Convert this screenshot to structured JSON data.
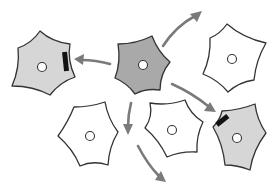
{
  "diagram": {
    "colors": {
      "background": "#ffffff",
      "outline": "#333333",
      "signaling_cell_fill": "#a9a9a9",
      "contacted_cell_fill": "#d6d6d6",
      "unaffected_cell_fill": "#ffffff",
      "arrow": "#7a7a7a",
      "contact_mark": "#111111"
    },
    "cells": [
      {
        "id": "source",
        "role": "signaling",
        "fill": "#a9a9a9",
        "center": [
          143,
          65
        ],
        "points": [
          [
            152,
            36
          ],
          [
            170,
            62
          ],
          [
            160,
            90
          ],
          [
            135,
            94
          ],
          [
            115,
            78
          ],
          [
            118,
            44
          ]
        ],
        "contact": false
      },
      {
        "id": "left",
        "role": "contacted",
        "fill": "#d6d6d6",
        "center": [
          42,
          67
        ],
        "points": [
          [
            40,
            31
          ],
          [
            70,
            44
          ],
          [
            75,
            77
          ],
          [
            50,
            95
          ],
          [
            12,
            86
          ],
          [
            18,
            48
          ]
        ],
        "contact": true
      },
      {
        "id": "top-right",
        "role": "unaffected",
        "fill": "#ffffff",
        "center": [
          232,
          59
        ],
        "points": [
          [
            227,
            24
          ],
          [
            266,
            43
          ],
          [
            254,
            80
          ],
          [
            228,
            92
          ],
          [
            203,
            74
          ],
          [
            210,
            38
          ]
        ],
        "contact": false
      },
      {
        "id": "bottom-left",
        "role": "unaffected",
        "fill": "#ffffff",
        "center": [
          90,
          136
        ],
        "points": [
          [
            105,
            102
          ],
          [
            118,
            132
          ],
          [
            108,
            165
          ],
          [
            80,
            166
          ],
          [
            58,
            136
          ],
          [
            74,
            107
          ]
        ],
        "contact": false
      },
      {
        "id": "bottom-middle",
        "role": "unaffected",
        "fill": "#ffffff",
        "center": [
          172,
          130
        ],
        "points": [
          [
            185,
            100
          ],
          [
            203,
            122
          ],
          [
            197,
            152
          ],
          [
            167,
            157
          ],
          [
            145,
            128
          ],
          [
            150,
            103
          ]
        ],
        "contact": false
      },
      {
        "id": "bottom-right",
        "role": "contacted",
        "fill": "#d6d6d6",
        "center": [
          237,
          138
        ],
        "points": [
          [
            255,
            104
          ],
          [
            266,
            133
          ],
          [
            250,
            170
          ],
          [
            225,
            165
          ],
          [
            213,
            127
          ],
          [
            222,
            111
          ]
        ],
        "contact": true
      }
    ],
    "arrows": [
      {
        "id": "to-left",
        "from": [
          110,
          64
        ],
        "to": [
          76,
          59
        ]
      },
      {
        "id": "to-top-right",
        "from": [
          163,
          45
        ],
        "to": [
          201,
          12
        ]
      },
      {
        "id": "to-bottom-right",
        "from": [
          172,
          84
        ],
        "to": [
          215,
          111
        ]
      },
      {
        "id": "to-bottom-middle-down",
        "from": [
          131,
          103
        ],
        "to": [
          128,
          134
        ]
      },
      {
        "id": "to-off-bottom",
        "from": [
          138,
          146
        ],
        "to": [
          165,
          181
        ]
      }
    ]
  }
}
